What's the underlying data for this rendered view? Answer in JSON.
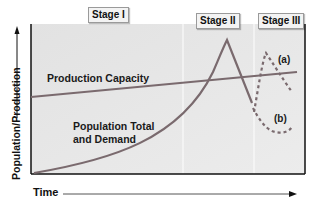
{
  "diagram": {
    "stages": [
      {
        "label": "Stage I"
      },
      {
        "label": "Stage II"
      },
      {
        "label": "Stage III"
      }
    ],
    "axes": {
      "y_label": "Population/Production",
      "x_label": "Time"
    },
    "curves": {
      "production_capacity": {
        "label": "Production Capacity"
      },
      "population": {
        "label_line1": "Population Total",
        "label_line2": "and Demand"
      },
      "scenario_a": {
        "label": "(a)"
      },
      "scenario_b": {
        "label": "(b)"
      }
    },
    "colors": {
      "plot_background": "#e6e6e6",
      "curve": "#7a6a6e",
      "frame": "#111111",
      "divider": "#fafafa"
    }
  }
}
